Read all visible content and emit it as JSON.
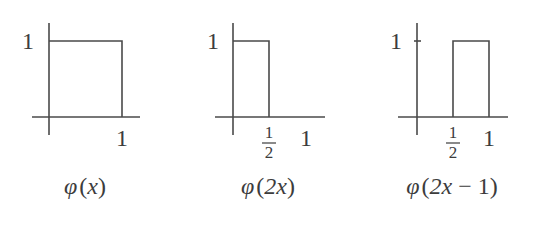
{
  "diagram": {
    "line_color": "#4a4a4a",
    "text_color": "#3c3c3c",
    "panels": [
      {
        "id": "phi-x",
        "caption_func": "φ",
        "caption_open": "(",
        "caption_arg": "x",
        "caption_close": ")",
        "y_tick_label": "1",
        "x_tick_labels": {
          "one": "1"
        },
        "box": {
          "x_start": 0,
          "x_end": 1,
          "height": 1
        }
      },
      {
        "id": "phi-2x",
        "caption_func": "φ",
        "caption_open": "(",
        "caption_arg": "2x",
        "caption_close": ")",
        "y_tick_label": "1",
        "x_tick_labels": {
          "half_num": "1",
          "half_den": "2",
          "one": "1"
        },
        "box": {
          "x_start": 0,
          "x_end": 0.5,
          "height": 1
        }
      },
      {
        "id": "phi-2x-minus-1",
        "caption_func": "φ",
        "caption_open": "(",
        "caption_arg": "2x",
        "caption_minus": "−",
        "caption_const": "1",
        "caption_close": ")",
        "y_tick_label": "1",
        "x_tick_labels": {
          "half_num": "1",
          "half_den": "2",
          "one": "1"
        },
        "box": {
          "x_start": 0.5,
          "x_end": 1,
          "height": 1
        }
      }
    ]
  }
}
